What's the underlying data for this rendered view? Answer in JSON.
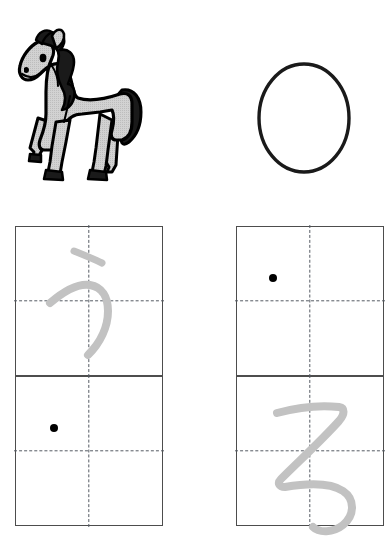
{
  "worksheet": {
    "type": "hiragana-writing-practice",
    "background_color": "#ffffff",
    "grid_line_color": "#4d4d4d",
    "guide_line_color": "#555a63",
    "trace_color": "#c2c2c2",
    "dot_color": "#000000"
  },
  "illustrations": [
    {
      "name": "horse",
      "alt": "horse",
      "body_color": "#c8c8c8",
      "outline_color": "#000000",
      "mane_color": "#1a1a1a"
    },
    {
      "name": "circle",
      "alt": "circle",
      "outline_color": "#1a1a1a",
      "fill_color": "#ffffff"
    }
  ],
  "practice_cells": [
    {
      "id": "cell-1",
      "column": 1,
      "row": 1,
      "trace_character": "う",
      "trace_romaji": "u",
      "has_start_dot": false,
      "start_dot": null
    },
    {
      "id": "cell-2",
      "column": 1,
      "row": 2,
      "trace_character": "",
      "trace_romaji": "",
      "has_start_dot": true,
      "start_dot": {
        "x": 34,
        "y": 47
      }
    },
    {
      "id": "cell-3",
      "column": 2,
      "row": 1,
      "trace_character": "",
      "trace_romaji": "",
      "has_start_dot": true,
      "start_dot": {
        "x": 32,
        "y": 47
      }
    },
    {
      "id": "cell-4",
      "column": 2,
      "row": 2,
      "trace_character": "る",
      "trace_romaji": "ru",
      "has_start_dot": false,
      "start_dot": null
    }
  ]
}
